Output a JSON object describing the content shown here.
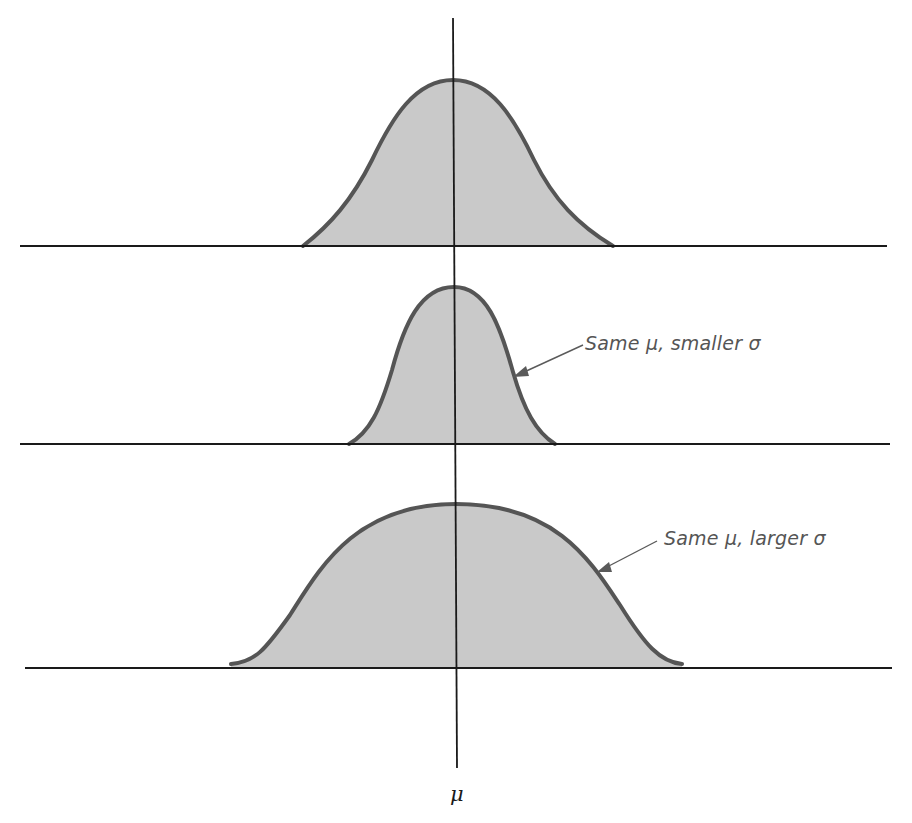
{
  "diagram": {
    "axis_label": "μ",
    "colors": {
      "fill": "#c9c9c9",
      "curve_stroke": "#555555",
      "axis": "#1a1a1a",
      "annotation_text": "#555555"
    },
    "panels": [
      {
        "id": "reference",
        "description": "Reference normal curve",
        "label": ""
      },
      {
        "id": "smaller-sigma",
        "description": "Narrower, taller curve",
        "label": "Same μ, smaller σ"
      },
      {
        "id": "larger-sigma",
        "description": "Wider, flatter curve",
        "label": "Same μ, larger σ"
      }
    ]
  }
}
